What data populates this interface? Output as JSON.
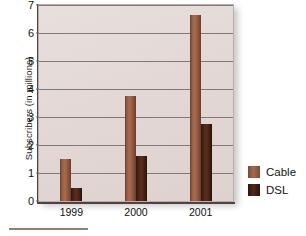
{
  "chart_data": {
    "type": "bar",
    "title": "",
    "xlabel": "",
    "ylabel": "Subscribers (in millions)",
    "categories": [
      "1999",
      "2000",
      "2001"
    ],
    "series": [
      {
        "name": "Cable",
        "color": "#9a6046",
        "values": [
          1.5,
          3.75,
          6.65
        ]
      },
      {
        "name": "DSL",
        "color": "#4d2517",
        "values": [
          0.45,
          1.62,
          2.75
        ]
      }
    ],
    "ylim": [
      0,
      7
    ],
    "yticks": [
      "0",
      "1",
      "2",
      "3",
      "4",
      "5",
      "6",
      "7"
    ],
    "grid": true,
    "legend_position": "right"
  },
  "axes": {
    "y_title": "Subscribers (in millions)",
    "y_ticks": [
      "0",
      "1",
      "2",
      "3",
      "4",
      "5",
      "6",
      "7"
    ],
    "x_ticks": [
      "1999",
      "2000",
      "2001"
    ]
  },
  "legend": {
    "items": [
      {
        "label": "Cable",
        "color": "#9a6046"
      },
      {
        "label": "DSL",
        "color": "#4d2517"
      }
    ]
  },
  "colors": {
    "plot_background": "#e3d8d5",
    "gridline": "#6f6866",
    "axis": "#4a4442",
    "cable": "#9a6046",
    "dsl": "#4d2517",
    "footer_rule": "#9b7b6b"
  }
}
